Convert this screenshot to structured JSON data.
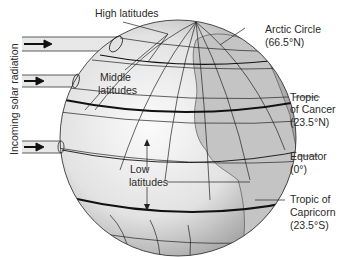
{
  "diagram": {
    "side_label": "Incoming solar radiation",
    "labels": {
      "high_latitudes": "High latitudes",
      "middle_latitudes_1": "Middle",
      "middle_latitudes_2": "latitudes",
      "low_latitudes_1": "Low",
      "low_latitudes_2": "latitudes",
      "arctic_circle_1": "Arctic Circle",
      "arctic_circle_2": "(66.5°N)",
      "tropic_cancer_1": "Tropic",
      "tropic_cancer_2": "of Cancer",
      "tropic_cancer_3": "(23.5°N)",
      "equator_1": "Equator",
      "equator_2": "(0°)",
      "tropic_capricorn_1": "Tropic of",
      "tropic_capricorn_2": "Capricorn",
      "tropic_capricorn_3": "(23.5°S)"
    },
    "colors": {
      "globe_light": "#f4f4f4",
      "globe_dark": "#9a9a9a",
      "land": "#c8c8c8",
      "beam": "#e6e6e6",
      "line": "#1a1a1a"
    }
  }
}
